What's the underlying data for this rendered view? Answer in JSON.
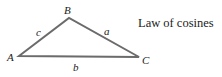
{
  "title": "Law of cosines",
  "triangle": {
    "vertices": {
      "A": {
        "label": "A",
        "x": 19,
        "y": 56
      },
      "B": {
        "label": "B",
        "x": 69,
        "y": 18
      },
      "C": {
        "label": "C",
        "x": 139,
        "y": 57
      }
    },
    "sides": {
      "a": {
        "label": "a"
      },
      "b": {
        "label": "b"
      },
      "c": {
        "label": "c"
      }
    },
    "stroke_color": "#6b6b6b"
  }
}
